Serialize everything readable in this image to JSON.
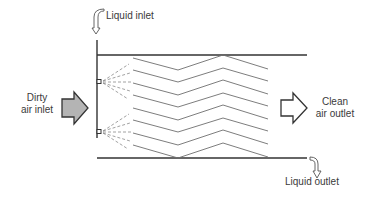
{
  "diagram": {
    "type": "wet scrubber schematic (chevron baffle / spray chamber)",
    "labels": {
      "liquid_inlet": "Liquid inlet",
      "dirty_air_line1": "Dirty",
      "dirty_air_line2": "air inlet",
      "clean_air_line1": "Clean",
      "clean_air_line2": "air outlet",
      "liquid_outlet": "Liquid outlet"
    },
    "colors": {
      "line": "#333333",
      "baffle": "#6e6e6e",
      "spray": "#8a8a8a",
      "inlet_arrow_fill": "#b4b4b4",
      "outlet_arrow_fill": "#ffffff",
      "text": "#3a3a3a"
    },
    "baffle_count": 8,
    "nozzle_count": 2
  }
}
